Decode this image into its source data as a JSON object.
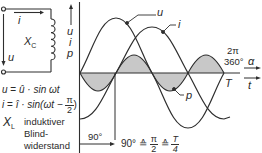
{
  "circuit": {
    "current_label": "i",
    "voltage_label": "u",
    "component_label": "X",
    "component_subscript": "C"
  },
  "formulas": {
    "voltage": {
      "lhs": "u",
      "eq": "=",
      "rhs": "û · sin ωt"
    },
    "current": {
      "lhs": "i",
      "eq": "=",
      "rhs": "î · sin(ωt −",
      "frac_num": "π",
      "frac_den": "2",
      "close": ")"
    }
  },
  "legend_note": {
    "symbol": "X",
    "subscript": "L",
    "line1": "induktiver",
    "line2": "Blind-",
    "line3": "widerstand"
  },
  "axes": {
    "y_labels": [
      "u",
      "i",
      "p"
    ],
    "x_label_angle": "α",
    "x_label_time": "t",
    "end_marker_rad": "2π",
    "end_marker_deg": "360°",
    "period_label": "T"
  },
  "annotations": {
    "phase_shift": "90°",
    "equivalence_prefix": "90°",
    "equiv_symbol": "≙",
    "pi_num": "π",
    "pi_den": "2",
    "t_num": "T",
    "t_den": "4"
  },
  "curve_labels": {
    "u": "u",
    "i": "i",
    "p": "p"
  },
  "colors": {
    "line": "#2e2e2e",
    "shade": "#c8c8c8",
    "background": "#ffffff"
  }
}
